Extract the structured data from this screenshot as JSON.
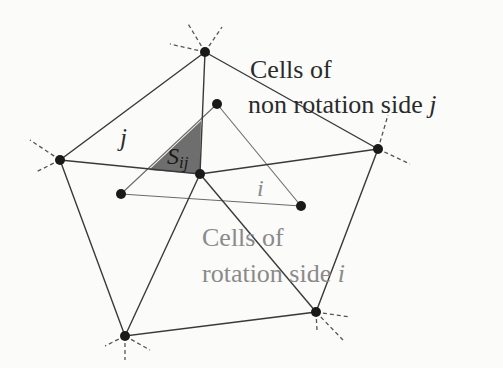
{
  "diagram": {
    "labels": {
      "non_rotation_line1": "Cells of",
      "non_rotation_line2": "non rotation side ",
      "non_rotation_var": "j",
      "rotation_line1": "Cells of",
      "rotation_line2": "rotation side ",
      "rotation_var": "i",
      "cell_j": "j",
      "cell_i": "i",
      "overlap_area_base": "S",
      "overlap_area_sub": "ij"
    },
    "colors": {
      "background": "#fbfbfa",
      "non_rotation_edges": "#3a3a3a",
      "rotation_edges": "#6a6a6a",
      "nodes": "#1a1a1a",
      "overlap_fill": "#6e6e6e",
      "label_dark": "#2a2a2a",
      "label_gray": "#8a8a8a"
    },
    "non_rotation_nodes": [
      {
        "id": "top",
        "x": 205,
        "y": 52
      },
      {
        "id": "right",
        "x": 378,
        "y": 149
      },
      {
        "id": "bottom-right",
        "x": 316,
        "y": 312
      },
      {
        "id": "bottom-left",
        "x": 125,
        "y": 336
      },
      {
        "id": "left",
        "x": 60,
        "y": 160
      },
      {
        "id": "center",
        "x": 200,
        "y": 174
      }
    ],
    "rotation_nodes": [
      {
        "id": "inner-top",
        "x": 217,
        "y": 104
      },
      {
        "id": "inner-left",
        "x": 121,
        "y": 194
      },
      {
        "id": "inner-right",
        "x": 301,
        "y": 206
      }
    ],
    "overlap_region": [
      [
        149,
        170
      ],
      [
        201,
        121
      ],
      [
        200,
        174
      ]
    ]
  }
}
